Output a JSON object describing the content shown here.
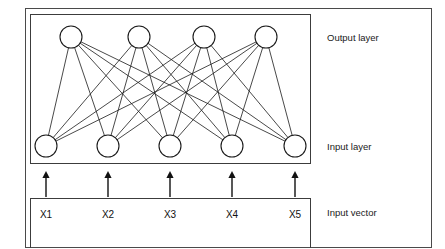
{
  "figure": {
    "type": "neural-network-diagram"
  },
  "labels": {
    "output_layer": "Output layer",
    "input_layer": "Input layer",
    "input_vector": "Input vector"
  },
  "input_vector": {
    "items": [
      {
        "label": "X1"
      },
      {
        "label": "X2"
      },
      {
        "label": "X3"
      },
      {
        "label": "X4"
      },
      {
        "label": "X5"
      }
    ]
  },
  "network": {
    "output_nodes": 4,
    "input_nodes": 5,
    "connections": "fully-connected",
    "connection_count": 20,
    "arrow_count": 5
  },
  "colors": {
    "stroke": "#1a1a1a",
    "frame": "#4a4a4a",
    "background": "#ffffff",
    "text": "#111111"
  },
  "geometry": {
    "output_node_cx": [
      71,
      139,
      204,
      266
    ],
    "output_node_cy": 37,
    "input_node_cx": [
      46,
      108,
      170,
      232,
      295
    ],
    "input_node_cy": 146,
    "node_r": 11,
    "arrow_x": [
      46,
      108,
      170,
      232,
      295
    ],
    "arrow_top": 171,
    "arrow_bottom": 197
  }
}
